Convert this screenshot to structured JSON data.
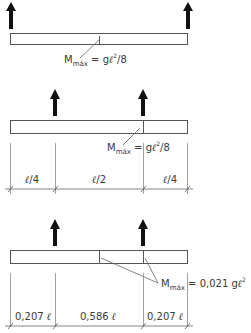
{
  "diagrams": [
    {
      "id": "simple-beam",
      "moment_label": {
        "M": "M",
        "sub": "máx",
        "eq": " = g",
        "ell": "ℓ",
        "sup": "2",
        "tail": "/8"
      },
      "support_count": 2
    },
    {
      "id": "overhang-quarter",
      "moment_label": {
        "M": "M",
        "sub": "máx",
        "eq": " = g",
        "ell": "ℓ",
        "sup": "2",
        "tail": "/8"
      },
      "dimensions": [
        {
          "num": "ℓ",
          "tail": "/4"
        },
        {
          "num": "ℓ",
          "tail": "/2"
        },
        {
          "num": "ℓ",
          "tail": "/4"
        }
      ]
    },
    {
      "id": "overhang-optimal",
      "moment_label": {
        "M": "M",
        "sub": "máx",
        "eq": " = 0,021 g",
        "ell": "ℓ",
        "sup": "2"
      },
      "dimensions": [
        {
          "num": "0,207 ",
          "ell": "ℓ"
        },
        {
          "num": "0,586 ",
          "ell": "ℓ"
        },
        {
          "num": "0,207 ",
          "ell": "ℓ"
        }
      ]
    }
  ]
}
